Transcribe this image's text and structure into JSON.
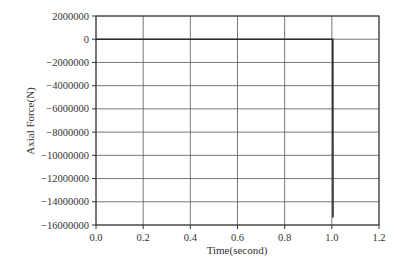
{
  "chart_data": {
    "type": "line",
    "title": "",
    "xlabel": "Time(second)",
    "ylabel": "Axial Force(N)",
    "xlim": [
      0.0,
      1.2
    ],
    "ylim": [
      -16000000,
      2000000
    ],
    "xticks": [
      "0.0",
      "0.2",
      "0.4",
      "0.6",
      "0.8",
      "1.0",
      "1.2"
    ],
    "xtick_values": [
      0.0,
      0.2,
      0.4,
      0.6,
      0.8,
      1.0,
      1.2
    ],
    "yticks": [
      "2000000",
      "0",
      "-2000000",
      "-4000000",
      "-6000000",
      "-8000000",
      "-10000000",
      "-12000000",
      "-14000000",
      "-16000000"
    ],
    "ytick_values": [
      2000000,
      0,
      -2000000,
      -4000000,
      -6000000,
      -8000000,
      -10000000,
      -12000000,
      -14000000,
      -16000000
    ],
    "grid": true,
    "legend": null,
    "series": [
      {
        "name": "Axial Force",
        "color": "#333333",
        "x": [
          0.0,
          0.2,
          0.4,
          0.6,
          0.8,
          1.0,
          1.004,
          1.005,
          1.006
        ],
        "y": [
          0,
          0,
          0,
          0,
          0,
          0,
          0,
          -15300000,
          -15300000
        ]
      }
    ]
  },
  "colors": {
    "grid": "#555555",
    "axis": "#333333",
    "line": "#2b2b2b",
    "background": "#ffffff"
  }
}
